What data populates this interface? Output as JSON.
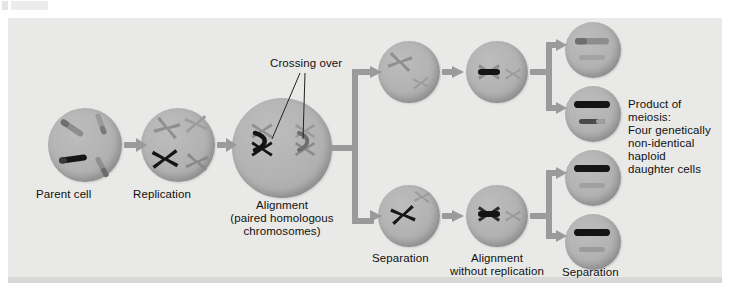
{
  "figure": {
    "kind": "meiosis-diagram",
    "panel_bg": "#e9e9e7",
    "cell_fill": "#b2b2b2",
    "arrow_color": "#9a9a9a",
    "chromosome_dark": "#161616",
    "chromosome_light": "#8a8a8a"
  },
  "labels": {
    "parent_cell": "Parent cell",
    "replication": "Replication",
    "alignment_line1": "Alignment",
    "alignment_line2": "(paired homologous",
    "alignment_line3": "chromosomes)",
    "crossing_over": "Crossing over",
    "separation_top": "Separation",
    "alignment_wo_line1": "Alignment",
    "alignment_wo_line2": "without replication",
    "separation_bottom": "Separation",
    "product_line1": "Product of",
    "product_line2": "meiosis:",
    "product_line3": "Four genetically",
    "product_line4": "non-identical",
    "product_line5": "haploid",
    "product_line6": "daughter cells"
  },
  "stages": [
    {
      "id": "parent-cell",
      "label": "Parent cell",
      "chromosomes": 4,
      "form": "unreplicated"
    },
    {
      "id": "replication",
      "label": "Replication",
      "chromosomes": 4,
      "form": "replicated-x"
    },
    {
      "id": "alignment",
      "label": "Alignment",
      "chromosomes": 4,
      "form": "tetrad-paired"
    },
    {
      "id": "separation-top",
      "label": "Separation",
      "chromosomes": 2,
      "form": "replicated-x"
    },
    {
      "id": "separation-bottom",
      "label": "Separation",
      "chromosomes": 2,
      "form": "replicated-x"
    },
    {
      "id": "alignment-wo-top",
      "label": "Alignment without replication",
      "chromosomes": 2,
      "form": "aligned"
    },
    {
      "id": "alignment-wo-bottom",
      "label": "Alignment without replication",
      "chromosomes": 2,
      "form": "aligned"
    },
    {
      "id": "product-1",
      "label": "Product of meiosis",
      "chromosomes": 2,
      "form": "haploid"
    },
    {
      "id": "product-2",
      "label": "Product of meiosis",
      "chromosomes": 2,
      "form": "haploid"
    },
    {
      "id": "product-3",
      "label": "Product of meiosis",
      "chromosomes": 2,
      "form": "haploid"
    },
    {
      "id": "product-4",
      "label": "Product of meiosis",
      "chromosomes": 2,
      "form": "haploid"
    }
  ]
}
